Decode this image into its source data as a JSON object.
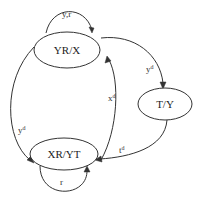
{
  "diagram": {
    "type": "state-transition-graph",
    "nodes": [
      {
        "id": "yrx",
        "label": "YR/X"
      },
      {
        "id": "ty",
        "label": "T/Y"
      },
      {
        "id": "xryt",
        "label": "XR/YT"
      }
    ],
    "edges": [
      {
        "from": "yrx",
        "to": "yrx",
        "label": "y,r"
      },
      {
        "from": "yrx",
        "to": "ty",
        "label_base": "y",
        "label_sup": "d"
      },
      {
        "from": "ty",
        "to": "xryt",
        "label_base": "t",
        "label_sup": "d"
      },
      {
        "from": "yrx",
        "to": "xryt",
        "label_base": "y",
        "label_sup": "d"
      },
      {
        "from": "xryt",
        "to": "yrx",
        "label_base": "x",
        "label_sup": "d"
      },
      {
        "from": "xryt",
        "to": "xryt",
        "label": "r"
      }
    ]
  }
}
